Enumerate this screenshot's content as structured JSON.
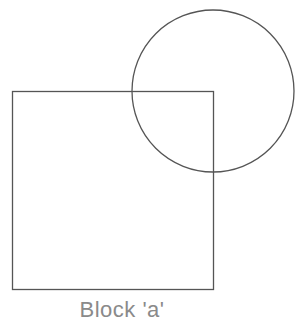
{
  "diagram": {
    "caption": "Block 'a'",
    "stroke_color": "#555555",
    "caption_color": "#8a8a8a",
    "shapes": [
      {
        "type": "square",
        "x": 12,
        "y": 91,
        "width": 201,
        "height": 198
      },
      {
        "type": "circle",
        "cx": 213,
        "cy": 91,
        "r": 81
      }
    ]
  }
}
